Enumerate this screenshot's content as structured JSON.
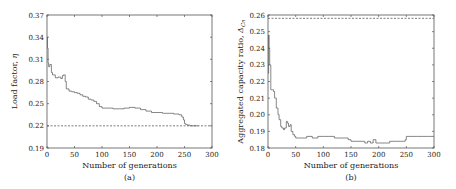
{
  "chart_data": [
    {
      "type": "line",
      "caption": "(a)",
      "title": "",
      "xlabel": "Number of generations",
      "ylabel": "Load factor, η",
      "xlim": [
        0,
        300
      ],
      "ylim": [
        0.19,
        0.37
      ],
      "xticks": [
        0,
        50,
        100,
        150,
        200,
        250,
        300
      ],
      "yticks": [
        0.19,
        0.22,
        0.25,
        0.28,
        0.31,
        0.34,
        0.37
      ],
      "xtick_labels": [
        "0",
        "50",
        "100",
        "150",
        "200",
        "250",
        "300"
      ],
      "ytick_labels": [
        "0.19",
        "0.22",
        "0.25",
        "0.28",
        "0.31",
        "0.34",
        "0.37"
      ],
      "grid": false,
      "reference_line": {
        "style": "dashed",
        "y": 0.22
      },
      "series": [
        {
          "name": "Load factor",
          "x": [
            0,
            1,
            2,
            3,
            5,
            8,
            10,
            15,
            20,
            25,
            28,
            30,
            33,
            35,
            40,
            45,
            50,
            55,
            60,
            65,
            70,
            75,
            80,
            85,
            90,
            95,
            100,
            110,
            120,
            130,
            140,
            150,
            160,
            170,
            180,
            190,
            200,
            210,
            220,
            230,
            240,
            245,
            248,
            250,
            252,
            255,
            260,
            270,
            275
          ],
          "y": [
            0.34,
            0.325,
            0.305,
            0.3,
            0.303,
            0.292,
            0.289,
            0.285,
            0.286,
            0.284,
            0.288,
            0.289,
            0.28,
            0.27,
            0.267,
            0.266,
            0.265,
            0.264,
            0.262,
            0.26,
            0.259,
            0.256,
            0.255,
            0.253,
            0.25,
            0.246,
            0.244,
            0.244,
            0.243,
            0.243,
            0.244,
            0.245,
            0.244,
            0.242,
            0.24,
            0.238,
            0.238,
            0.237,
            0.237,
            0.236,
            0.235,
            0.232,
            0.228,
            0.223,
            0.222,
            0.221,
            0.22,
            0.22,
            0.22
          ]
        }
      ]
    },
    {
      "type": "line",
      "caption": "(b)",
      "title": "",
      "xlabel": "Number of generations",
      "ylabel": "Aggregated capacity ratio, Δ_Cn",
      "xlim": [
        0,
        300
      ],
      "ylim": [
        0.18,
        0.26
      ],
      "xticks": [
        0,
        50,
        100,
        150,
        200,
        250,
        300
      ],
      "yticks": [
        0.18,
        0.19,
        0.2,
        0.21,
        0.22,
        0.23,
        0.24,
        0.25,
        0.26
      ],
      "xtick_labels": [
        "0",
        "50",
        "100",
        "150",
        "200",
        "250",
        "300"
      ],
      "ytick_labels": [
        "0.18",
        "0.19",
        "0.20",
        "0.21",
        "0.22",
        "0.23",
        "0.24",
        "0.25",
        "0.26"
      ],
      "grid": false,
      "reference_line": {
        "style": "dashed",
        "y": 0.258
      },
      "series": [
        {
          "name": "Aggregated capacity ratio",
          "x": [
            0,
            1,
            2,
            3,
            5,
            6,
            10,
            12,
            15,
            18,
            20,
            23,
            25,
            28,
            30,
            33,
            35,
            37,
            40,
            42,
            45,
            48,
            50,
            55,
            60,
            65,
            70,
            80,
            85,
            90,
            100,
            110,
            120,
            130,
            140,
            145,
            150,
            160,
            170,
            175,
            180,
            185,
            190,
            195,
            200,
            210,
            220,
            230,
            240,
            245,
            248,
            250,
            260,
            270,
            280,
            290,
            300
          ],
          "y": [
            0.225,
            0.248,
            0.24,
            0.23,
            0.215,
            0.215,
            0.214,
            0.21,
            0.204,
            0.2,
            0.197,
            0.193,
            0.192,
            0.191,
            0.192,
            0.196,
            0.195,
            0.193,
            0.194,
            0.19,
            0.188,
            0.187,
            0.186,
            0.186,
            0.186,
            0.186,
            0.187,
            0.186,
            0.186,
            0.187,
            0.187,
            0.187,
            0.186,
            0.186,
            0.186,
            0.185,
            0.184,
            0.184,
            0.184,
            0.183,
            0.184,
            0.183,
            0.185,
            0.183,
            0.183,
            0.183,
            0.184,
            0.184,
            0.184,
            0.184,
            0.185,
            0.187,
            0.187,
            0.187,
            0.187,
            0.187,
            0.187
          ]
        }
      ]
    }
  ],
  "panels": {
    "a": {
      "caption": "(a)",
      "xlabel": "Number of generations",
      "ylabel_text": "Load factor, ",
      "ylabel_symbol": "η",
      "xtick_labels": [
        "0",
        "50",
        "100",
        "150",
        "200",
        "250",
        "300"
      ],
      "ytick_labels": [
        "0.19",
        "0.22",
        "0.25",
        "0.28",
        "0.31",
        "0.34",
        "0.37"
      ]
    },
    "b": {
      "caption": "(b)",
      "xlabel": "Number of generations",
      "ylabel_text": "Aggregated capacity ratio, ",
      "ylabel_symbol": "Δ",
      "ylabel_subscript": "Cn",
      "xtick_labels": [
        "0",
        "50",
        "100",
        "150",
        "200",
        "250",
        "300"
      ],
      "ytick_labels": [
        "0.18",
        "0.19",
        "0.20",
        "0.21",
        "0.22",
        "0.23",
        "0.24",
        "0.25",
        "0.26"
      ]
    }
  },
  "colors": {
    "line": "#555555",
    "axis": "#444444",
    "text": "#222222",
    "reference": "#444444"
  }
}
